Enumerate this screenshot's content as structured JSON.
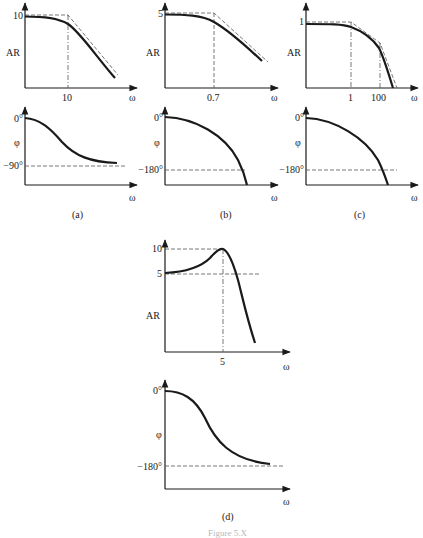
{
  "figure": {
    "caption_clipped": "Figure 5.X",
    "panels": [
      {
        "id": "a",
        "label": "(a)",
        "ar_plot": {
          "ylabel": "AR",
          "y_tick": "10",
          "x_tick": "10",
          "xlabel": "ω"
        },
        "phase_plot": {
          "ylabel": "φ",
          "y_top": "0°",
          "y_asymptote": "−90°",
          "xlabel": "ω"
        }
      },
      {
        "id": "b",
        "label": "(b)",
        "ar_plot": {
          "ylabel": "AR",
          "y_tick": "5",
          "x_tick": "0.7",
          "xlabel": "ω"
        },
        "phase_plot": {
          "ylabel": "φ",
          "y_top": "0°",
          "y_asymptote": "−180°",
          "xlabel": "ω"
        }
      },
      {
        "id": "c",
        "label": "(c)",
        "ar_plot": {
          "ylabel": "AR",
          "y_tick": "1",
          "x_ticks": [
            "1",
            "100"
          ],
          "xlabel": "ω"
        },
        "phase_plot": {
          "ylabel": "φ",
          "y_top": "0°",
          "y_asymptote": "−180°",
          "xlabel": "ω"
        }
      },
      {
        "id": "d",
        "label": "(d)",
        "ar_plot": {
          "ylabel": "AR",
          "y_ticks": [
            "10",
            "5"
          ],
          "x_tick": "5",
          "xlabel": "ω"
        },
        "phase_plot": {
          "ylabel": "φ",
          "y_top": "0°",
          "y_asymptote": "−180°",
          "xlabel": "ω"
        }
      }
    ]
  },
  "colors": {
    "curve": "#1a1a1a",
    "dashed": "#555555",
    "background": "#ffffff"
  }
}
